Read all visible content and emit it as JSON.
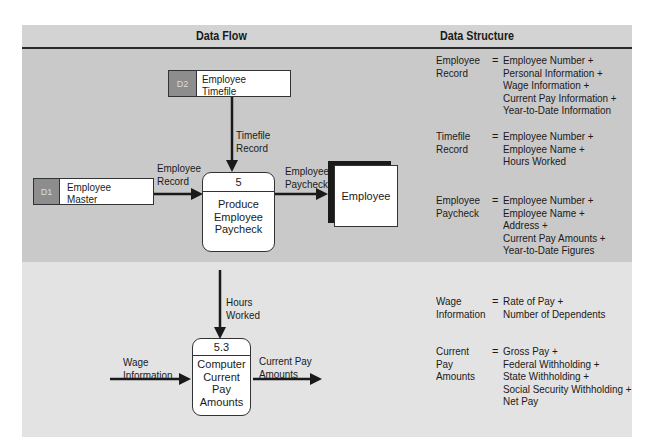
{
  "header": {
    "left_title": "Data Flow",
    "right_title": "Data Structure"
  },
  "colors": {
    "header_bg": "#d3d3d3",
    "top_section_bg": "#c9c9c9",
    "bottom_section_bg": "#e3e3e3",
    "store_id_bg": "#8d8d8d",
    "line": "#1a1a1a"
  },
  "data_flow": {
    "stores": [
      {
        "id": "D2",
        "name_lines": [
          "Employee",
          "Timefile"
        ]
      },
      {
        "id": "D1",
        "name_lines": [
          "Employee",
          "Master"
        ]
      }
    ],
    "processes": [
      {
        "id": "5",
        "name_lines": [
          "Produce",
          "Employee",
          "Paycheck"
        ]
      },
      {
        "id": "5.3",
        "name_lines": [
          "Computer",
          "Current",
          "Pay",
          "Amounts"
        ]
      }
    ],
    "entities": [
      {
        "name": "Employee"
      }
    ],
    "flows": [
      {
        "label_lines": [
          "Timefile",
          "Record"
        ],
        "from": "D2",
        "to": "5"
      },
      {
        "label_lines": [
          "Employee",
          "Record"
        ],
        "from": "D1",
        "to": "5"
      },
      {
        "label_lines": [
          "Employee",
          "Paycheck"
        ],
        "from": "5",
        "to": "Employee"
      },
      {
        "label_lines": [
          "Hours",
          "Worked"
        ],
        "from": "",
        "to": "5.3"
      },
      {
        "label_lines": [
          "Wage",
          "Information"
        ],
        "from": "",
        "to": "5.3"
      },
      {
        "label_lines": [
          "Current Pay",
          "Amounts"
        ],
        "from": "5.3",
        "to": ""
      }
    ]
  },
  "data_structure": {
    "equals": "=",
    "top": [
      {
        "term_lines": [
          "Employee",
          "Record"
        ],
        "def_lines": [
          "Employee Number +",
          "Personal Information +",
          "Wage Information +",
          "Current Pay Information +",
          "Year-to-Date Information"
        ]
      },
      {
        "term_lines": [
          "Timefile",
          "Record"
        ],
        "def_lines": [
          "Employee Number +",
          "Employee Name +",
          "Hours Worked"
        ]
      },
      {
        "term_lines": [
          "Employee",
          "Paycheck"
        ],
        "def_lines": [
          "Employee Number +",
          "Employee Name +",
          "Address +",
          "Current Pay Amounts +",
          "Year-to-Date Figures"
        ]
      }
    ],
    "bottom": [
      {
        "term_lines": [
          "Wage",
          "Information"
        ],
        "def_lines": [
          "Rate of Pay +",
          "Number of Dependents"
        ]
      },
      {
        "term_lines": [
          "Current",
          "Pay",
          "Amounts"
        ],
        "def_lines": [
          "Gross Pay +",
          "Federal Withholding +",
          "State Withholding +",
          "Social Security Withholding +",
          "Net Pay"
        ]
      }
    ]
  }
}
